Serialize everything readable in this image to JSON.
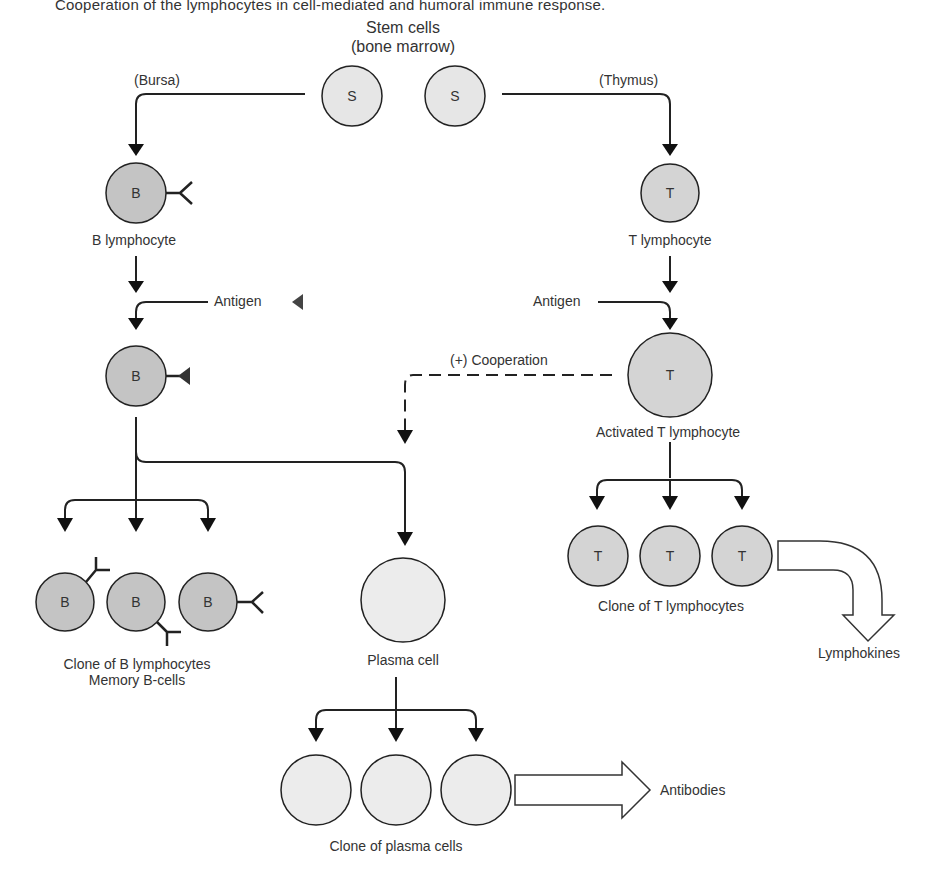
{
  "caption_partial": "Cooperation of the lymphocytes in cell-mediated and humoral immune response.",
  "stem": {
    "title": "Stem cells",
    "subtitle": "(bone marrow)",
    "cell_letter": "S"
  },
  "bursa_label": "(Bursa)",
  "thymus_label": "(Thymus)",
  "b_branch": {
    "cell_letter": "B",
    "b_lymphocyte_label": "B lymphocyte",
    "antigen_label": "Antigen",
    "clone_label": "Clone of B lymphocytes",
    "memory_label": "Memory B-cells"
  },
  "t_branch": {
    "cell_letter": "T",
    "t_lymphocyte_label": "T lymphocyte",
    "antigen_label": "Antigen",
    "activated_label": "Activated T lymphocyte",
    "clone_label": "Clone of T lymphocytes",
    "output_label": "Lymphokines"
  },
  "cooperation_label": "(+) Cooperation",
  "plasma": {
    "plasma_cell_label": "Plasma cell",
    "clone_label": "Clone of plasma cells",
    "output_label": "Antibodies"
  },
  "colors": {
    "b_cell_fill": "#c4c4c4",
    "t_cell_fill": "#d4d4d4",
    "stem_fill": "#e6e6e6",
    "plasma_fill": "#ececec",
    "stroke": "#222222"
  }
}
